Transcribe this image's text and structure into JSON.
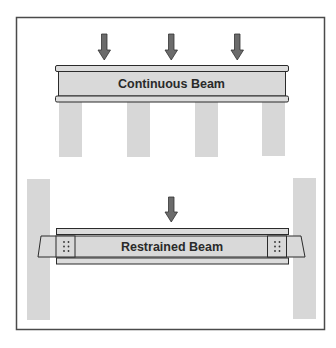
{
  "diagram": {
    "panels": [
      {
        "id": "continuous",
        "label": "Continuous Beam",
        "load_arrows": 3,
        "supports": 4
      },
      {
        "id": "restrained",
        "label": "Restrained Beam",
        "load_arrows": 1,
        "supports": 2
      }
    ],
    "colors": {
      "frame": "#444444",
      "beam_fill": "#d9d9d9",
      "flange_fill": "#dcdcdc",
      "outline": "#2b2b2b",
      "support_fill": "#d7d7d7",
      "arrow_fill": "#6b6b6b",
      "bolt": "#333333"
    }
  }
}
